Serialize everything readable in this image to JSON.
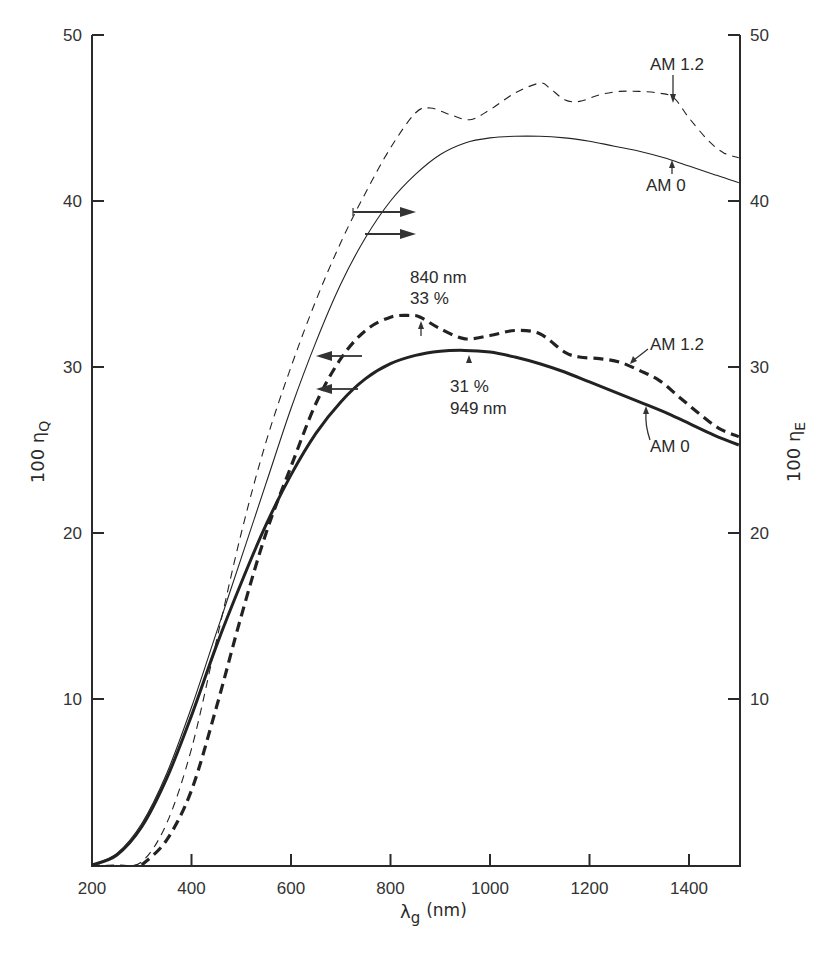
{
  "chart_data": {
    "type": "line",
    "title": "",
    "xlabel": "λg (nm)",
    "xlabel_main": "λ",
    "xlabel_sub": "g",
    "xlabel_unit": "(nm)",
    "ylabel_left": "100 ηQ",
    "ylabel_left_main": "100 η",
    "ylabel_left_sub": "Q",
    "ylabel_right": "100 ηE",
    "ylabel_right_main": "100 η",
    "ylabel_right_sub": "E",
    "xlim": [
      200,
      1500
    ],
    "ylim": [
      0,
      50
    ],
    "x_ticks": [
      200,
      400,
      600,
      800,
      1000,
      1200,
      1400
    ],
    "x_tick_labels": [
      "200",
      "400",
      "600",
      "800",
      "1000",
      "1200",
      "1400"
    ],
    "y_ticks": [
      10,
      20,
      30,
      40,
      50
    ],
    "y_tick_labels": [
      "10",
      "20",
      "30",
      "40",
      "50"
    ],
    "grid": false,
    "legend": "none (inline annotations)",
    "series": [
      {
        "name": "AM 1.2 (η_E, right axis)",
        "axis": "right",
        "style": "thin-dashed",
        "x": [
          200,
          250,
          300,
          350,
          400,
          450,
          500,
          550,
          600,
          650,
          700,
          750,
          800,
          850,
          880,
          920,
          960,
          1000,
          1050,
          1100,
          1120,
          1150,
          1180,
          1220,
          1260,
          1300,
          1340,
          1370,
          1400,
          1440,
          1470,
          1500
        ],
        "values": [
          0,
          0,
          0.2,
          2.5,
          7.0,
          13.5,
          20.0,
          25.5,
          30.0,
          34.0,
          37.5,
          40.5,
          43.2,
          45.3,
          45.6,
          45.2,
          44.9,
          45.5,
          46.5,
          47.1,
          46.8,
          46.1,
          46.0,
          46.4,
          46.6,
          46.6,
          46.5,
          46.2,
          45.0,
          43.6,
          42.9,
          42.6
        ]
      },
      {
        "name": "AM 0 (η_E, right axis)",
        "axis": "right",
        "style": "thin-solid",
        "x": [
          200,
          250,
          300,
          350,
          400,
          450,
          500,
          550,
          600,
          650,
          700,
          750,
          800,
          850,
          900,
          950,
          1000,
          1050,
          1100,
          1150,
          1200,
          1250,
          1300,
          1350,
          1400,
          1450,
          1500
        ],
        "values": [
          0,
          0.7,
          2.5,
          5.5,
          9.5,
          14.0,
          18.5,
          23.0,
          27.5,
          31.5,
          35.0,
          37.8,
          40.0,
          41.6,
          42.8,
          43.5,
          43.8,
          43.9,
          43.9,
          43.8,
          43.6,
          43.3,
          43.0,
          42.6,
          42.1,
          41.6,
          41.1
        ]
      },
      {
        "name": "AM 1.2 (η_Q, left axis)",
        "axis": "left",
        "style": "thick-dashed",
        "x": [
          300,
          350,
          400,
          450,
          500,
          550,
          600,
          650,
          700,
          750,
          800,
          840,
          860,
          900,
          950,
          1000,
          1050,
          1100,
          1150,
          1180,
          1220,
          1260,
          1300,
          1340,
          1380,
          1420,
          1460,
          1500
        ],
        "values": [
          0,
          1.5,
          4.5,
          9.5,
          15.0,
          20.0,
          24.0,
          27.8,
          30.5,
          32.2,
          33.0,
          33.1,
          33.0,
          32.3,
          31.7,
          31.9,
          32.2,
          32.0,
          30.9,
          30.6,
          30.5,
          30.3,
          29.8,
          29.2,
          28.2,
          27.2,
          26.3,
          25.8
        ]
      },
      {
        "name": "AM 0 (η_Q, left axis)",
        "axis": "left",
        "style": "thick-solid",
        "x": [
          200,
          250,
          300,
          350,
          400,
          450,
          500,
          550,
          600,
          650,
          700,
          750,
          800,
          850,
          900,
          949,
          1000,
          1050,
          1100,
          1150,
          1200,
          1250,
          1300,
          1350,
          1400,
          1450,
          1500
        ],
        "values": [
          0,
          0.6,
          2.3,
          5.2,
          9.0,
          13.2,
          17.0,
          20.5,
          23.5,
          26.0,
          27.9,
          29.3,
          30.2,
          30.7,
          30.95,
          31.0,
          30.9,
          30.6,
          30.2,
          29.7,
          29.1,
          28.5,
          27.9,
          27.3,
          26.6,
          25.9,
          25.3
        ]
      }
    ],
    "annotations": [
      {
        "id": "am12_upper",
        "text": "AM 1.2",
        "target_series": 0,
        "arrow_x": 1370,
        "arrow_y": 46.2
      },
      {
        "id": "am0_upper",
        "text": "AM 0",
        "target_series": 1,
        "arrow_x": 1370,
        "arrow_y": 42.2
      },
      {
        "id": "peak_am12",
        "text_line1": "840 nm",
        "text_line2": "33 %",
        "x": 840,
        "y": 33
      },
      {
        "id": "peak_am0",
        "text_line1": "31 %",
        "text_line2": "949 nm",
        "x": 949,
        "y": 31
      },
      {
        "id": "am12_lower",
        "text": "AM 1.2",
        "target_series": 2,
        "arrow_x": 1260,
        "arrow_y": 30.3
      },
      {
        "id": "am0_lower",
        "text": "AM 0",
        "target_series": 3,
        "arrow_x": 1300,
        "arrow_y": 27.9
      },
      {
        "id": "axis_arrows_right",
        "description": "two arrows pointing right indicating upper curves read on right axis"
      },
      {
        "id": "axis_arrows_left",
        "description": "two arrows pointing left indicating lower curves read on left axis"
      }
    ]
  },
  "labels": {
    "am12_upper": "AM 1.2",
    "am0_upper": "AM 0",
    "peak_am12_line1": "840 nm",
    "peak_am12_line2": "33 %",
    "peak_am0_line1": "31 %",
    "peak_am0_line2": "949 nm",
    "am12_lower": "AM 1.2",
    "am0_lower": "AM 0"
  }
}
